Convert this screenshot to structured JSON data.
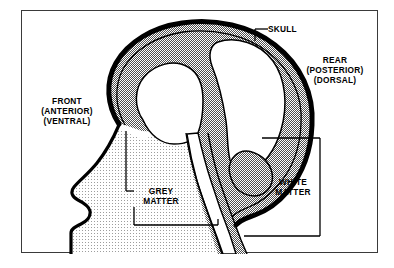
{
  "figure": {
    "frame": {
      "border_color": "#3a3a3a"
    },
    "colors": {
      "skull_outline": "#000000",
      "grey_matter_fill": "#9a9a9a",
      "white_matter_fill": "#ffffff",
      "head_tissue_fill": "#e6e6e6",
      "label_text": "#000000",
      "leader_line": "#000000",
      "frame_border": "#3a3a3a",
      "background": "#ffffff"
    },
    "labels": [
      {
        "id": "skull",
        "name": "skull-label",
        "lines": [
          "SKULL"
        ],
        "leader": "elbow-down-left"
      },
      {
        "id": "rear",
        "name": "rear-orientation-label",
        "lines": [
          "REAR",
          "(POSTERIOR)",
          "(DORSAL)"
        ],
        "leader": "none"
      },
      {
        "id": "front",
        "name": "front-orientation-label",
        "lines": [
          "FRONT",
          "(ANTERIOR)",
          "(VENTRAL)"
        ],
        "leader": "none"
      },
      {
        "id": "grey_matter",
        "name": "grey-matter-label",
        "lines": [
          "GREY",
          "MATTER"
        ],
        "leader": "two-brackets"
      },
      {
        "id": "white_matter",
        "name": "white-matter-label",
        "lines": [
          "WHITE",
          "MATTER"
        ],
        "leader": "right-bracket"
      }
    ],
    "regions": [
      {
        "id": "skull",
        "label": "SKULL",
        "description": "thick black outline enclosing the brain"
      },
      {
        "id": "grey_matter",
        "label": "GREY MATTER",
        "description": "stippled mid-grey cortical band and brainstem edge"
      },
      {
        "id": "white_matter",
        "label": "WHITE MATTER",
        "description": "white interior lobes of the cerebrum"
      },
      {
        "id": "head_tissue",
        "label": "",
        "description": "light stippled face, jaw and neck tissue"
      }
    ]
  }
}
